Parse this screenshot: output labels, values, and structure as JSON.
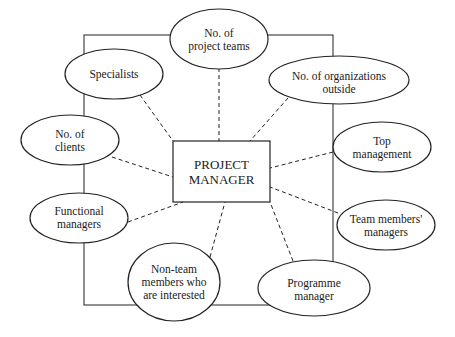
{
  "diagram": {
    "center": {
      "line1": "PROJECT",
      "line2": "MANAGER"
    },
    "nodes": [
      {
        "id": "project-teams",
        "lines": [
          "No. of",
          "project teams"
        ]
      },
      {
        "id": "specialists",
        "lines": [
          "Specialists"
        ]
      },
      {
        "id": "organizations-outside",
        "lines": [
          "No. of organizations",
          "outside"
        ]
      },
      {
        "id": "clients",
        "lines": [
          "No. of",
          "clients"
        ]
      },
      {
        "id": "top-management",
        "lines": [
          "Top",
          "management"
        ]
      },
      {
        "id": "functional-managers",
        "lines": [
          "Functional",
          "managers"
        ]
      },
      {
        "id": "team-members-managers",
        "lines": [
          "Team members'",
          "managers"
        ]
      },
      {
        "id": "non-team-members",
        "lines": [
          "Non-team",
          "members who",
          "are interested"
        ]
      },
      {
        "id": "programme-manager",
        "lines": [
          "Programme",
          "manager"
        ]
      }
    ]
  }
}
